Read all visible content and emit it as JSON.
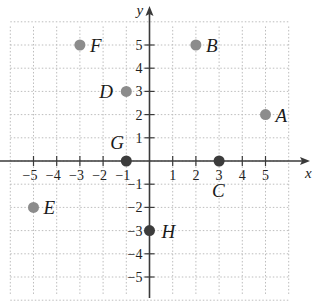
{
  "axes": {
    "x_label": "x",
    "y_label": "y",
    "x_ticks": [
      {
        "v": -5,
        "label": "−5"
      },
      {
        "v": -4,
        "label": "−4"
      },
      {
        "v": -3,
        "label": "−3"
      },
      {
        "v": -2,
        "label": "−2"
      },
      {
        "v": -1,
        "label": "−1"
      },
      {
        "v": 1,
        "label": "1"
      },
      {
        "v": 2,
        "label": "2"
      },
      {
        "v": 3,
        "label": "3"
      },
      {
        "v": 4,
        "label": "4"
      },
      {
        "v": 5,
        "label": "5"
      }
    ],
    "y_ticks": [
      {
        "v": 5,
        "label": "5"
      },
      {
        "v": 4,
        "label": "4"
      },
      {
        "v": 3,
        "label": "3"
      },
      {
        "v": 2,
        "label": "2"
      },
      {
        "v": 1,
        "label": "1"
      },
      {
        "v": -1,
        "label": "−1"
      },
      {
        "v": -2,
        "label": "−2"
      },
      {
        "v": -3,
        "label": "−3"
      },
      {
        "v": -4,
        "label": "−4"
      },
      {
        "v": -5,
        "label": "−5"
      }
    ],
    "grid": "dotted"
  },
  "colors": {
    "axis": "#3a3a3a",
    "grid": "#bdbdbd",
    "point_gray": "#8c8c8c",
    "point_dark": "#3c3c3c"
  },
  "points": [
    {
      "name": "A",
      "x": 5,
      "y": 2,
      "style": "gray",
      "label_dx": 10,
      "label_dy": 7
    },
    {
      "name": "B",
      "x": 2,
      "y": 5,
      "style": "gray",
      "label_dx": 10,
      "label_dy": 7
    },
    {
      "name": "C",
      "x": 3,
      "y": 0,
      "style": "dark",
      "label_dx": -7,
      "label_dy": 36
    },
    {
      "name": "D",
      "x": -1,
      "y": 3,
      "style": "gray",
      "label_dx": -27,
      "label_dy": 7
    },
    {
      "name": "E",
      "x": -5,
      "y": -2,
      "style": "gray",
      "label_dx": 10,
      "label_dy": 7
    },
    {
      "name": "F",
      "x": -3,
      "y": 5,
      "style": "gray",
      "label_dx": 10,
      "label_dy": 7
    },
    {
      "name": "G",
      "x": -1,
      "y": 0,
      "style": "dark",
      "label_dx": -16,
      "label_dy": -12
    },
    {
      "name": "H",
      "x": 0,
      "y": -3,
      "style": "dark",
      "label_dx": 12,
      "label_dy": 7
    }
  ],
  "chart_data": {
    "type": "scatter",
    "title": "",
    "xlabel": "x",
    "ylabel": "y",
    "xlim": [
      -6,
      6
    ],
    "ylim": [
      -6,
      6
    ],
    "grid": true,
    "series": [
      {
        "name": "points",
        "labels": [
          "A",
          "B",
          "C",
          "D",
          "E",
          "F",
          "G",
          "H"
        ],
        "x": [
          5,
          2,
          3,
          -1,
          -5,
          -3,
          -1,
          0
        ],
        "y": [
          2,
          5,
          0,
          3,
          -2,
          5,
          0,
          -3
        ]
      }
    ]
  }
}
